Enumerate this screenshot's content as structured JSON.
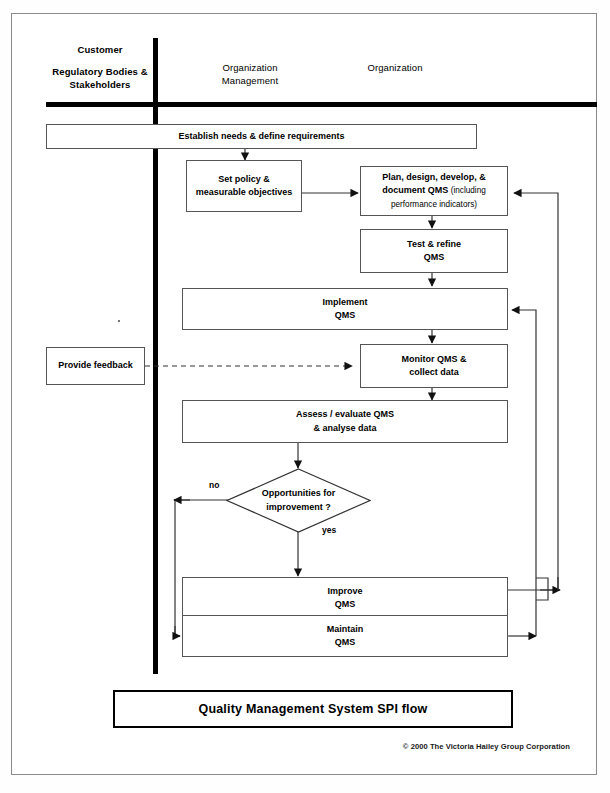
{
  "document": {
    "title": "Quality Management System SPI flow",
    "copyright": "© 2000 The Victoria Hailey Group Corporation"
  },
  "lanes": [
    {
      "id": "customer",
      "line1": "Customer",
      "line2": "Regulatory Bodies &\nStakeholders"
    },
    {
      "id": "org-management",
      "label": "Organization\nManagement"
    },
    {
      "id": "organization",
      "label": "Organization"
    }
  ],
  "lane_headers": {
    "customer_top": "Customer",
    "customer_sub": "Regulatory Bodies & Stakeholders",
    "customer_sub_line1": "Regulatory Bodies &",
    "customer_sub_line2": "Stakeholders",
    "org_management_line1": "Organization",
    "org_management_line2": "Management",
    "organization": "Organization"
  },
  "nodes": {
    "establish": {
      "label": "Establish needs & define requirements",
      "shape": "process"
    },
    "set_policy": {
      "line1": "Set policy &",
      "line2": "measurable objectives",
      "shape": "process"
    },
    "plan": {
      "line1": "Plan, design, develop, &",
      "line2": "document QMS",
      "line2_small": "(including",
      "line3_small": "performance indicators)",
      "shape": "process"
    },
    "test": {
      "line1": "Test & refine",
      "line2": "QMS",
      "shape": "process"
    },
    "implement": {
      "line1": "Implement",
      "line2": "QMS",
      "shape": "process"
    },
    "monitor": {
      "line1": "Monitor QMS &",
      "line2": "collect data",
      "shape": "process"
    },
    "assess": {
      "line1": "Assess / evaluate QMS",
      "line2": "& analyse data",
      "shape": "process"
    },
    "decision": {
      "line1": "Opportunities for",
      "line2": "improvement ?",
      "shape": "decision"
    },
    "improve": {
      "line1": "Improve",
      "line2": "QMS",
      "shape": "process"
    },
    "maintain": {
      "line1": "Maintain",
      "line2": "QMS",
      "shape": "process"
    },
    "feedback": {
      "label": "Provide feedback",
      "shape": "process"
    }
  },
  "branches": {
    "no": "no",
    "yes": "yes"
  },
  "edges": [
    {
      "from": "establish",
      "to": "set_policy",
      "style": "solid"
    },
    {
      "from": "set_policy",
      "to": "plan",
      "style": "solid"
    },
    {
      "from": "plan",
      "to": "test",
      "style": "solid"
    },
    {
      "from": "test",
      "to": "implement",
      "style": "solid"
    },
    {
      "from": "implement",
      "to": "monitor",
      "style": "solid"
    },
    {
      "from": "feedback",
      "to": "monitor",
      "style": "dashed"
    },
    {
      "from": "monitor",
      "to": "assess",
      "style": "solid"
    },
    {
      "from": "assess",
      "to": "decision",
      "style": "solid"
    },
    {
      "from": "decision",
      "to": "improve",
      "style": "solid",
      "label": "yes"
    },
    {
      "from": "decision",
      "to": "maintain",
      "style": "solid",
      "label": "no"
    },
    {
      "from": "improve",
      "to": "plan",
      "style": "solid"
    },
    {
      "from": "maintain",
      "to": "implement",
      "style": "solid"
    }
  ],
  "colors": {
    "line": "#555555",
    "rule": "#000000",
    "text": "#000000",
    "frame": "#8a8a8a",
    "background": "#ffffff"
  }
}
